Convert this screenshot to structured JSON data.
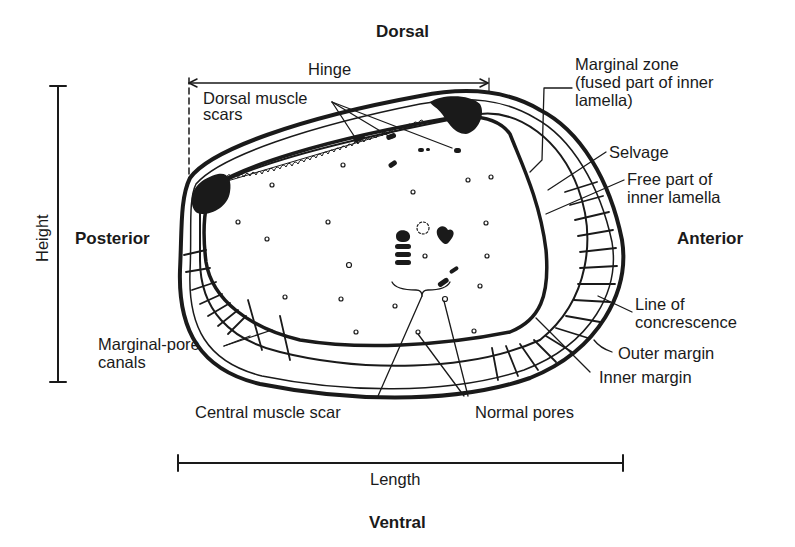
{
  "figure": {
    "orientation": {
      "top": "Dorsal",
      "bottom": "Ventral",
      "left": "Posterior",
      "right": "Anterior"
    },
    "dimensions": {
      "hinge": "Hinge",
      "height": "Height",
      "length": "Length"
    },
    "labels": {
      "dorsal_muscle_scars_1": "Dorsal muscle",
      "dorsal_muscle_scars_2": "scars",
      "marginal_zone_1": "Marginal zone",
      "marginal_zone_2": "(fused part of inner",
      "marginal_zone_3": "lamella)",
      "selvage": "Selvage",
      "free_part_1": "Free part of",
      "free_part_2": "inner lamella",
      "line_of_concrescence_1": "Line of",
      "line_of_concrescence_2": "concrescence",
      "outer_margin": "Outer margin",
      "inner_margin": "Inner margin",
      "marginal_pore_canals_1": "Marginal-pore",
      "marginal_pore_canals_2": "canals",
      "central_muscle_scar": "Central muscle scar",
      "normal_pores": "Normal pores"
    },
    "colors": {
      "ink": "#1a1a1a",
      "background": "#ffffff"
    }
  }
}
